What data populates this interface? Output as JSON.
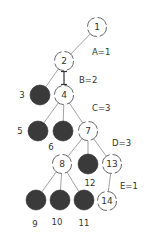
{
  "diagram": {
    "type": "tree",
    "colors": {
      "filled": "#3a3a3a",
      "open_stroke": "#555555",
      "edge": "#8a8a8a"
    },
    "nodes": [
      {
        "id": "n1",
        "label": "1",
        "x": 97,
        "y": 27,
        "filled": false,
        "label_inside": true
      },
      {
        "id": "n2",
        "label": "2",
        "x": 64,
        "y": 61,
        "filled": false,
        "label_inside": true
      },
      {
        "id": "n3",
        "label": "3",
        "x": 40,
        "y": 95,
        "filled": true,
        "label_x": 22,
        "label_y": 95
      },
      {
        "id": "n4",
        "label": "4",
        "x": 64,
        "y": 95,
        "filled": false,
        "label_inside": true
      },
      {
        "id": "n5",
        "label": "5",
        "x": 38,
        "y": 131,
        "filled": true,
        "label_x": 20,
        "label_y": 131
      },
      {
        "id": "n6",
        "label": "6",
        "x": 63,
        "y": 131,
        "filled": true,
        "label_x": 51,
        "label_y": 147
      },
      {
        "id": "n7",
        "label": "7",
        "x": 88,
        "y": 131,
        "filled": false,
        "label_inside": true
      },
      {
        "id": "n8",
        "label": "8",
        "x": 62,
        "y": 164,
        "filled": false,
        "label_inside": true
      },
      {
        "id": "n12",
        "label": "12",
        "x": 88,
        "y": 164,
        "filled": true,
        "label_x": 90,
        "label_y": 183
      },
      {
        "id": "n13",
        "label": "13",
        "x": 112,
        "y": 164,
        "filled": false,
        "label_inside": true
      },
      {
        "id": "n9",
        "label": "9",
        "x": 36,
        "y": 200,
        "filled": true,
        "label_x": 35,
        "label_y": 224
      },
      {
        "id": "n10",
        "label": "10",
        "x": 60,
        "y": 200,
        "filled": true,
        "label_x": 57,
        "label_y": 222
      },
      {
        "id": "n11",
        "label": "11",
        "x": 84,
        "y": 200,
        "filled": true,
        "label_x": 84,
        "label_y": 223
      },
      {
        "id": "n14",
        "label": "14",
        "x": 107,
        "y": 201,
        "filled": false,
        "label_inside": true
      }
    ],
    "edges": [
      {
        "from": "n1",
        "to": "n2"
      },
      {
        "from": "n2",
        "to": "n3"
      },
      {
        "from": "n2",
        "to": "n4",
        "style": "bar"
      },
      {
        "from": "n4",
        "to": "n5"
      },
      {
        "from": "n4",
        "to": "n6"
      },
      {
        "from": "n4",
        "to": "n7"
      },
      {
        "from": "n7",
        "to": "n8"
      },
      {
        "from": "n7",
        "to": "n12"
      },
      {
        "from": "n7",
        "to": "n13"
      },
      {
        "from": "n8",
        "to": "n9"
      },
      {
        "from": "n8",
        "to": "n10"
      },
      {
        "from": "n8",
        "to": "n11"
      },
      {
        "from": "n13",
        "to": "n14"
      }
    ],
    "weights": [
      {
        "text": "A=1",
        "x": 92,
        "y": 52
      },
      {
        "text": "B=2",
        "x": 79,
        "y": 80
      },
      {
        "text": "C=3",
        "x": 92,
        "y": 108
      },
      {
        "text": "D=3",
        "x": 112,
        "y": 143
      },
      {
        "text": "E=1",
        "x": 120,
        "y": 186
      }
    ]
  }
}
